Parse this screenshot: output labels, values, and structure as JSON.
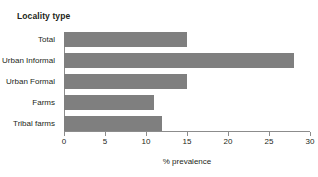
{
  "chart_data": {
    "type": "bar",
    "orientation": "horizontal",
    "title": "",
    "subtitle": "",
    "categories": [
      "Total",
      "Urban Informal",
      "Urban Formal",
      "Farms",
      "Tribal farms"
    ],
    "values": [
      15,
      28,
      15,
      11,
      12
    ],
    "series": [
      {
        "name": "% prevalence",
        "values": [
          15,
          28,
          15,
          11,
          12
        ]
      }
    ],
    "xlabel": "% prevalence",
    "ylabel": "Locality type",
    "xlim": [
      0,
      30
    ],
    "xticks": [
      0,
      5,
      10,
      15,
      20,
      25,
      30
    ],
    "xtick_labels": [
      "0",
      "5",
      "10",
      "15",
      "20",
      "25",
      "30"
    ],
    "grid": false,
    "legend": false,
    "legend_position": "none",
    "bar_color": "#7f7f7f",
    "axis_color": "#8c8c8c",
    "text_color": "#231f20",
    "background": "#ffffff"
  },
  "axis_title": "Locality type",
  "x_axis_label": "% prevalence"
}
